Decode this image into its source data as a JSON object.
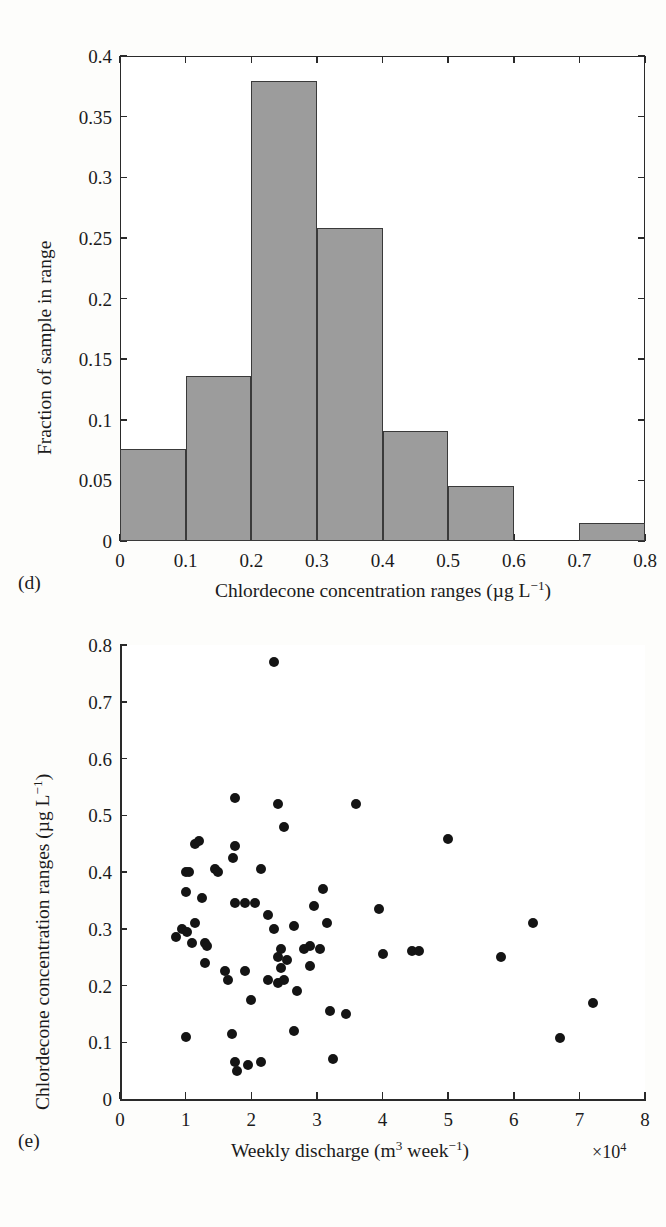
{
  "figure": {
    "background": "#fdfdfb",
    "ink_color": "#1b1b1b",
    "bar_fill": "#9c9c9c",
    "bar_edge": "#3a3a3a",
    "dot_color": "#141414"
  },
  "panels": [
    {
      "label": "(d)",
      "type": "histogram"
    },
    {
      "label": "(e)",
      "type": "scatter"
    }
  ],
  "chart_data": [
    {
      "type": "bar",
      "panel": "(d)",
      "title": "",
      "xlabel_parts": {
        "text": "Chlordecone concentration ranges (µg L",
        "sup": "−1",
        "tail": ")"
      },
      "xlabel": "Chlordecone concentration ranges (µg L−1)",
      "ylabel": "Fraction of sample in range",
      "xlim": [
        0,
        0.8
      ],
      "ylim": [
        0,
        0.4
      ],
      "grid": false,
      "legend": "none",
      "bin_edges": [
        0,
        0.1,
        0.2,
        0.3,
        0.4,
        0.5,
        0.6,
        0.7,
        0.8
      ],
      "categories": [
        "0–0.1",
        "0.1–0.2",
        "0.2–0.3",
        "0.3–0.4",
        "0.4–0.5",
        "0.5–0.6",
        "0.6–0.7",
        "0.7–0.8"
      ],
      "values": [
        0.076,
        0.136,
        0.379,
        0.258,
        0.091,
        0.045,
        0.0,
        0.015
      ],
      "xticks": [
        "0",
        "0.1",
        "0.2",
        "0.3",
        "0.4",
        "0.5",
        "0.6",
        "0.7",
        "0.8"
      ],
      "xtick_values": [
        0,
        0.1,
        0.2,
        0.3,
        0.4,
        0.5,
        0.6,
        0.7,
        0.8
      ],
      "yticks": [
        "0",
        "0.05",
        "0.1",
        "0.15",
        "0.2",
        "0.25",
        "0.3",
        "0.35",
        "0.4"
      ],
      "ytick_values": [
        0,
        0.05,
        0.1,
        0.15,
        0.2,
        0.25,
        0.3,
        0.35,
        0.4
      ]
    },
    {
      "type": "scatter",
      "panel": "(e)",
      "title": "",
      "xlabel_parts": {
        "text": "Weekly discharge (m",
        "sup1": "3",
        "mid": " week",
        "sup2": "−1",
        "tail": ")"
      },
      "xlabel": "Weekly discharge (m3 week−1)",
      "ylabel": "Chlordecone concentration ranges (µg L−1)",
      "x_multiplier": "×10⁴",
      "xlim": [
        0,
        8
      ],
      "ylim": [
        0,
        0.8
      ],
      "grid": false,
      "legend": "none",
      "xticks": [
        "0",
        "1",
        "2",
        "3",
        "4",
        "5",
        "6",
        "7",
        "8"
      ],
      "xtick_values": [
        0,
        1,
        2,
        3,
        4,
        5,
        6,
        7,
        8
      ],
      "yticks": [
        "0",
        "0.1",
        "0.2",
        "0.3",
        "0.4",
        "0.5",
        "0.6",
        "0.7",
        "0.8"
      ],
      "ytick_values": [
        0,
        0.1,
        0.2,
        0.3,
        0.4,
        0.5,
        0.6,
        0.7,
        0.8
      ],
      "points": [
        [
          2.35,
          0.77
        ],
        [
          1.75,
          0.53
        ],
        [
          2.4,
          0.52
        ],
        [
          3.6,
          0.52
        ],
        [
          5.0,
          0.458
        ],
        [
          2.5,
          0.48
        ],
        [
          1.15,
          0.45
        ],
        [
          1.2,
          0.455
        ],
        [
          1.75,
          0.445
        ],
        [
          1.72,
          0.425
        ],
        [
          1.0,
          0.4
        ],
        [
          1.05,
          0.4
        ],
        [
          1.45,
          0.405
        ],
        [
          1.5,
          0.4
        ],
        [
          2.15,
          0.405
        ],
        [
          3.1,
          0.37
        ],
        [
          1.0,
          0.365
        ],
        [
          1.25,
          0.355
        ],
        [
          2.95,
          0.34
        ],
        [
          3.95,
          0.335
        ],
        [
          1.75,
          0.345
        ],
        [
          1.9,
          0.345
        ],
        [
          2.05,
          0.345
        ],
        [
          2.25,
          0.325
        ],
        [
          0.95,
          0.3
        ],
        [
          1.02,
          0.295
        ],
        [
          1.15,
          0.31
        ],
        [
          2.65,
          0.305
        ],
        [
          3.15,
          0.31
        ],
        [
          6.3,
          0.31
        ],
        [
          0.85,
          0.285
        ],
        [
          1.1,
          0.275
        ],
        [
          1.3,
          0.275
        ],
        [
          1.33,
          0.27
        ],
        [
          2.35,
          0.3
        ],
        [
          2.45,
          0.265
        ],
        [
          2.9,
          0.27
        ],
        [
          3.05,
          0.265
        ],
        [
          4.0,
          0.255
        ],
        [
          4.45,
          0.26
        ],
        [
          4.55,
          0.26
        ],
        [
          5.8,
          0.25
        ],
        [
          1.3,
          0.24
        ],
        [
          2.4,
          0.25
        ],
        [
          2.55,
          0.245
        ],
        [
          2.8,
          0.265
        ],
        [
          1.6,
          0.225
        ],
        [
          1.9,
          0.225
        ],
        [
          2.45,
          0.23
        ],
        [
          2.9,
          0.235
        ],
        [
          7.2,
          0.17
        ],
        [
          1.65,
          0.21
        ],
        [
          2.25,
          0.21
        ],
        [
          2.4,
          0.205
        ],
        [
          2.5,
          0.21
        ],
        [
          2.7,
          0.19
        ],
        [
          2.0,
          0.175
        ],
        [
          3.2,
          0.155
        ],
        [
          3.45,
          0.15
        ],
        [
          2.65,
          0.12
        ],
        [
          1.0,
          0.11
        ],
        [
          1.7,
          0.115
        ],
        [
          6.7,
          0.108
        ],
        [
          1.75,
          0.065
        ],
        [
          1.78,
          0.05
        ],
        [
          1.95,
          0.06
        ],
        [
          2.15,
          0.065
        ],
        [
          3.25,
          0.07
        ]
      ]
    }
  ]
}
